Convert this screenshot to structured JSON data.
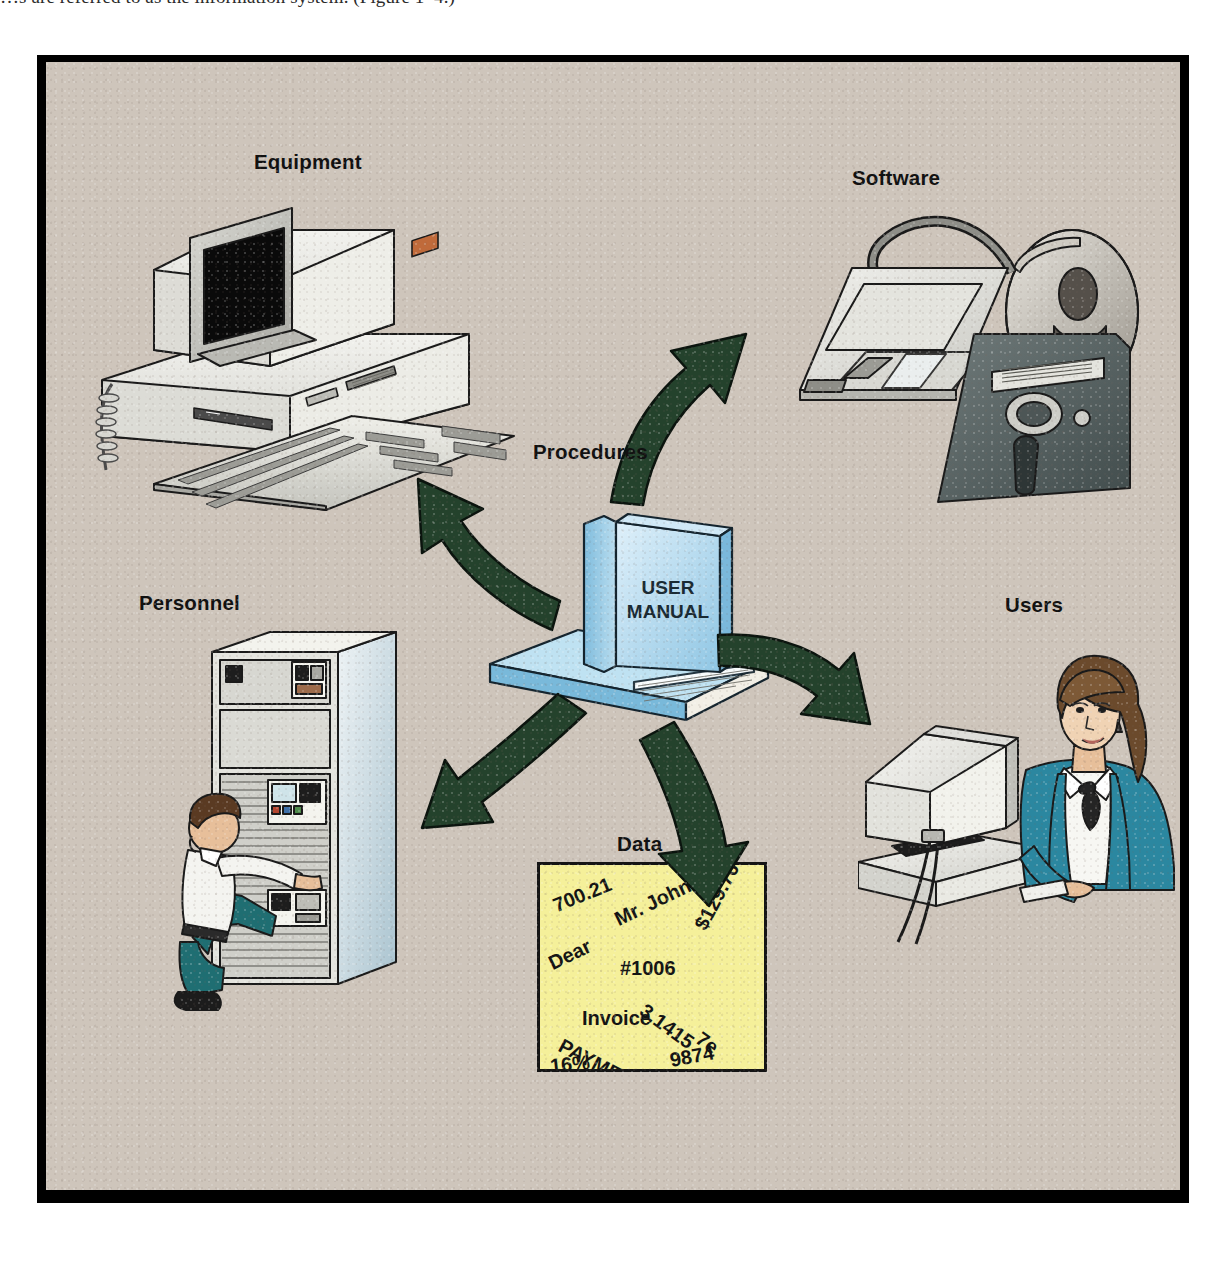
{
  "page": {
    "running_text": "…s are referred to as the information system. (Figure 1–4.)"
  },
  "figure": {
    "background_color": "#cec5bb",
    "border_color": "#000000",
    "arrow_color": "#24422c",
    "center": {
      "label": "Procedures",
      "book_title_line1": "USER",
      "book_title_line2": "MANUAL",
      "book_color": "#9fd0e8"
    },
    "nodes": [
      {
        "id": "equipment",
        "label": "Equipment",
        "art": "desktop-computer"
      },
      {
        "id": "software",
        "label": "Software",
        "art": "floppy-disks-and-tape-reel"
      },
      {
        "id": "personnel",
        "label": "Personnel",
        "art": "technician-at-mainframe"
      },
      {
        "id": "users",
        "label": "Users",
        "art": "woman-at-terminal"
      },
      {
        "id": "data",
        "label": "Data",
        "art": "yellow-data-sheet"
      }
    ],
    "arrows": [
      {
        "id": "to-equipment",
        "from": "procedures",
        "to": "equipment"
      },
      {
        "id": "to-software",
        "from": "procedures",
        "to": "software"
      },
      {
        "id": "to-personnel",
        "from": "procedures",
        "to": "personnel"
      },
      {
        "id": "to-users",
        "from": "procedures",
        "to": "users"
      },
      {
        "id": "to-data",
        "from": "procedures",
        "to": "data"
      }
    ],
    "data_sheet": {
      "paper_color": "#f5f09a",
      "tokens": [
        {
          "text": "700.21",
          "x": 14,
          "y": 30,
          "rot": -22,
          "size": 20
        },
        {
          "text": "Mr. Johnson",
          "x": 76,
          "y": 44,
          "rot": -26,
          "size": 20
        },
        {
          "text": "$129.76",
          "x": 160,
          "y": 52,
          "rot": -62,
          "size": 20
        },
        {
          "text": "Dear",
          "x": 10,
          "y": 88,
          "rot": -26,
          "size": 20
        },
        {
          "text": "#1006",
          "x": 80,
          "y": 92,
          "rot": 0,
          "size": 20
        },
        {
          "text": "3.1415",
          "x": 102,
          "y": 132,
          "rot": 36,
          "size": 20
        },
        {
          "text": "7e",
          "x": 158,
          "y": 160,
          "rot": 36,
          "size": 20
        },
        {
          "text": "Invoice",
          "x": 42,
          "y": 142,
          "rot": 0,
          "size": 20
        },
        {
          "text": "PAYMENTS",
          "x": 20,
          "y": 168,
          "rot": 28,
          "size": 20
        },
        {
          "text": "16%",
          "x": 10,
          "y": 190,
          "rot": -6,
          "size": 20
        },
        {
          "text": "9874",
          "x": 130,
          "y": 184,
          "rot": -10,
          "size": 20
        }
      ]
    }
  }
}
